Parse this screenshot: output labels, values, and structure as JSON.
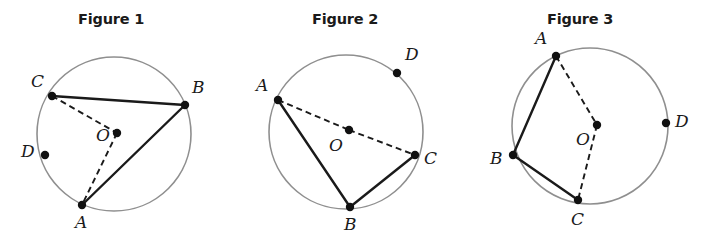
{
  "page": {
    "background": "#ffffff",
    "width": 705,
    "height": 248
  },
  "style": {
    "circle_stroke": "#8f8f8f",
    "chord_stroke": "#1a1a1a",
    "dashed_stroke": "#1a1a1a",
    "point_fill": "#111111",
    "label_color": "#1a1a1a",
    "circle_stroke_width": 1.6,
    "chord_stroke_width": 2.4,
    "dash_pattern": "6,4",
    "point_radius": 4.2
  },
  "figures": [
    {
      "id": "figure-1",
      "title": "Figure 1",
      "title_pos": {
        "x": 78,
        "y": 11
      },
      "circle": {
        "cx": 114,
        "cy": 134,
        "r": 77
      },
      "center_point": {
        "label": "O",
        "x": 117,
        "y": 133,
        "label_x": 96,
        "label_y": 127
      },
      "points": [
        {
          "label": "C",
          "x": 52,
          "y": 96,
          "label_x": 31,
          "label_y": 73
        },
        {
          "label": "B",
          "x": 185,
          "y": 105,
          "label_x": 192,
          "label_y": 79
        },
        {
          "label": "D",
          "x": 45,
          "y": 155,
          "label_x": 21,
          "label_y": 143
        },
        {
          "label": "A",
          "x": 82,
          "y": 205,
          "label_x": 75,
          "label_y": 214
        }
      ],
      "solid_segments": [
        {
          "from": "C",
          "to": "B"
        },
        {
          "from": "B",
          "to": "A"
        }
      ],
      "dashed_segments": [
        {
          "from": "C",
          "to": "O"
        },
        {
          "from": "O",
          "to": "A"
        }
      ]
    },
    {
      "id": "figure-2",
      "title": "Figure 2",
      "title_pos": {
        "x": 312,
        "y": 11
      },
      "circle": {
        "cx": 346,
        "cy": 132,
        "r": 77
      },
      "center_point": {
        "label": "O",
        "x": 349,
        "y": 130,
        "label_x": 329,
        "label_y": 137
      },
      "points": [
        {
          "label": "A",
          "x": 278,
          "y": 100,
          "label_x": 256,
          "label_y": 77
        },
        {
          "label": "D",
          "x": 397,
          "y": 73,
          "label_x": 405,
          "label_y": 46
        },
        {
          "label": "C",
          "x": 415,
          "y": 155,
          "label_x": 424,
          "label_y": 150
        },
        {
          "label": "B",
          "x": 350,
          "y": 207,
          "label_x": 344,
          "label_y": 216
        }
      ],
      "solid_segments": [
        {
          "from": "A",
          "to": "B"
        },
        {
          "from": "B",
          "to": "C"
        }
      ],
      "dashed_segments": [
        {
          "from": "A",
          "to": "O"
        },
        {
          "from": "O",
          "to": "C"
        }
      ]
    },
    {
      "id": "figure-3",
      "title": "Figure 3",
      "title_pos": {
        "x": 547,
        "y": 11
      },
      "circle": {
        "cx": 590,
        "cy": 126,
        "r": 78
      },
      "center_point": {
        "label": "O",
        "x": 597,
        "y": 125,
        "label_x": 576,
        "label_y": 131
      },
      "points": [
        {
          "label": "A",
          "x": 556,
          "y": 56,
          "label_x": 535,
          "label_y": 30
        },
        {
          "label": "B",
          "x": 513,
          "y": 155,
          "label_x": 490,
          "label_y": 150
        },
        {
          "label": "C",
          "x": 578,
          "y": 200,
          "label_x": 571,
          "label_y": 211
        },
        {
          "label": "D",
          "x": 666,
          "y": 123,
          "label_x": 675,
          "label_y": 113
        }
      ],
      "solid_segments": [
        {
          "from": "A",
          "to": "B"
        },
        {
          "from": "B",
          "to": "C"
        }
      ],
      "dashed_segments": [
        {
          "from": "A",
          "to": "O"
        },
        {
          "from": "O",
          "to": "C"
        }
      ]
    }
  ]
}
